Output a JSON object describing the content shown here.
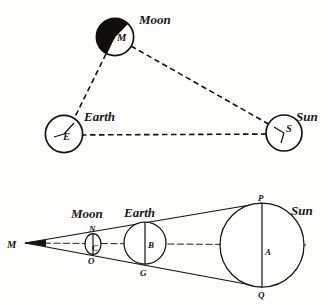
{
  "figure": {
    "ink_color": "#15120f",
    "background_color": "#fdfdfc"
  },
  "top_diagram": {
    "name": "earth-moon-sun-triangle",
    "bodies": {
      "moon": {
        "label": "Moon",
        "center_letter": "M",
        "cx": 115,
        "cy": 37,
        "r": 19,
        "shaded": true,
        "shade_side": "left"
      },
      "earth": {
        "label": "Earth",
        "center_letter": "E",
        "cx": 64,
        "cy": 134,
        "r": 19,
        "shaded": false
      },
      "sun": {
        "label": "Sun",
        "center_letter": "S",
        "cx": 284,
        "cy": 133,
        "r": 18,
        "shaded": false
      }
    },
    "connections": [
      {
        "from": "moon",
        "to": "earth",
        "style": "dashed"
      },
      {
        "from": "moon",
        "to": "sun",
        "style": "dashed"
      },
      {
        "from": "earth",
        "to": "sun",
        "style": "dashed"
      }
    ]
  },
  "bottom_diagram": {
    "name": "shadow-cone-geometry",
    "apex": {
      "label": "M",
      "x": 25,
      "y": 243
    },
    "bodies": {
      "moon": {
        "label": "Moon",
        "cx": 93,
        "cy": 244,
        "rx": 8,
        "ry": 11,
        "top_letter": "N",
        "bottom_letter": "O",
        "center_letter": "C"
      },
      "earth": {
        "label": "Earth",
        "cx": 145,
        "cy": 243,
        "r": 21,
        "top_letter": "",
        "bottom_letter": "G",
        "center_letter": "B"
      },
      "sun": {
        "label": "Sun",
        "cx": 262,
        "cy": 245,
        "r": 42,
        "top_letter": "P",
        "bottom_letter": "Q",
        "center_letter": "A"
      }
    },
    "rays": [
      {
        "name": "upper-tangent-ray",
        "from": "M",
        "to": "P"
      },
      {
        "name": "lower-tangent-ray",
        "from": "M",
        "to": "Q"
      },
      {
        "name": "central-axis",
        "from": "M",
        "to": "A"
      }
    ]
  }
}
